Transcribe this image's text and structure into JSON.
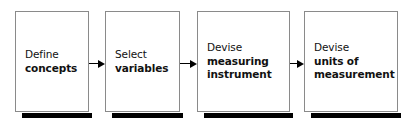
{
  "diagram": {
    "type": "process-flow",
    "orientation": "left-to-right",
    "background_color": "#ffffff",
    "border_color": "#8a8a8a",
    "shadow_color": "#000000",
    "text_color": "#111111",
    "nodes": [
      {
        "id": "node-1",
        "name": "define-concepts",
        "line1": "Define",
        "line2": "concepts",
        "line3": "",
        "x": 15,
        "y": 11,
        "width": 74,
        "height": 101
      },
      {
        "id": "node-2",
        "name": "select-variables",
        "line1": "Select",
        "line2": "variables",
        "line3": "",
        "x": 105,
        "y": 11,
        "width": 75,
        "height": 101
      },
      {
        "id": "node-3",
        "name": "devise-measuring-instrument",
        "line1": "Devise",
        "line2": "measuring",
        "line3": "instrument",
        "x": 197,
        "y": 11,
        "width": 93,
        "height": 101
      },
      {
        "id": "node-4",
        "name": "devise-units-of-measurement",
        "line1": "Devise",
        "line2": "units of",
        "line3": "measurement",
        "x": 304,
        "y": 11,
        "width": 94,
        "height": 101
      }
    ],
    "connectors": [
      {
        "id": "arrow-1",
        "name": "arrow-node1-to-node2",
        "from": "node-1",
        "to": "node-2",
        "x": 89,
        "y": 58,
        "width": 16
      },
      {
        "id": "arrow-2",
        "name": "arrow-node2-to-node3",
        "from": "node-2",
        "to": "node-3",
        "x": 180,
        "y": 58,
        "width": 17
      },
      {
        "id": "arrow-3",
        "name": "arrow-node3-to-node4",
        "from": "node-3",
        "to": "node-4",
        "x": 290,
        "y": 58,
        "width": 14
      }
    ]
  }
}
